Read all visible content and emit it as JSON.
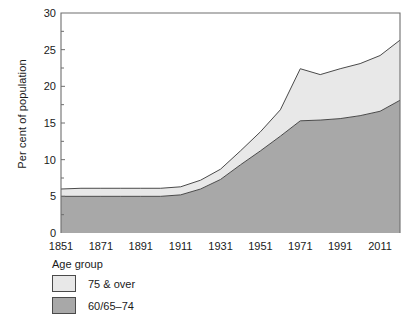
{
  "chart_data": {
    "type": "area",
    "stacked": true,
    "title": "",
    "subtitle": "",
    "xlabel": "",
    "ylabel": "Per cent of population",
    "xlim": [
      1851,
      2021
    ],
    "ylim": [
      0,
      30
    ],
    "yticks": [
      0,
      5,
      10,
      15,
      20,
      25,
      30
    ],
    "xticks": [
      1851,
      1871,
      1891,
      1911,
      1931,
      1951,
      1971,
      1991,
      2011
    ],
    "grid": false,
    "legend_position": "below-left",
    "legend_title": "Age group",
    "x": [
      1851,
      1861,
      1871,
      1881,
      1891,
      1901,
      1911,
      1921,
      1931,
      1941,
      1951,
      1961,
      1971,
      1981,
      1991,
      2001,
      2011,
      2021
    ],
    "series": [
      {
        "name": "60/65-74",
        "display_name": "60/65–74",
        "color": "#a8a8a8",
        "values": [
          5.0,
          5.0,
          5.0,
          5.0,
          5.0,
          5.0,
          5.2,
          6.0,
          7.3,
          9.3,
          11.2,
          13.2,
          15.3,
          15.4,
          15.6,
          16.0,
          16.6,
          18.1
        ]
      },
      {
        "name": "75 & over",
        "display_name": "75 & over",
        "color": "#e8e8e8",
        "values": [
          1.0,
          1.1,
          1.1,
          1.1,
          1.1,
          1.1,
          1.1,
          1.2,
          1.4,
          1.9,
          2.6,
          3.6,
          7.1,
          6.2,
          6.8,
          7.1,
          7.6,
          8.2
        ]
      }
    ],
    "totals": [
      6.0,
      6.1,
      6.1,
      6.1,
      6.1,
      6.1,
      6.3,
      7.2,
      8.7,
      11.2,
      13.8,
      16.8,
      22.4,
      21.6,
      22.4,
      23.1,
      24.2,
      26.3
    ],
    "axis_color": "#6e6e6e",
    "line_color": "#4a4a4a"
  },
  "axes": {
    "ylabel": "Per cent of population",
    "ytick_labels": [
      "0",
      "5",
      "10",
      "15",
      "20",
      "25",
      "30"
    ],
    "xtick_labels": [
      "1851",
      "1871",
      "1891",
      "1911",
      "1931",
      "1951",
      "1971",
      "1991",
      "2011"
    ]
  },
  "legend": {
    "title": "Age group",
    "items": [
      {
        "label": "75 & over",
        "color": "#e8e8e8"
      },
      {
        "label": "60/65–74",
        "color": "#a8a8a8"
      }
    ]
  }
}
